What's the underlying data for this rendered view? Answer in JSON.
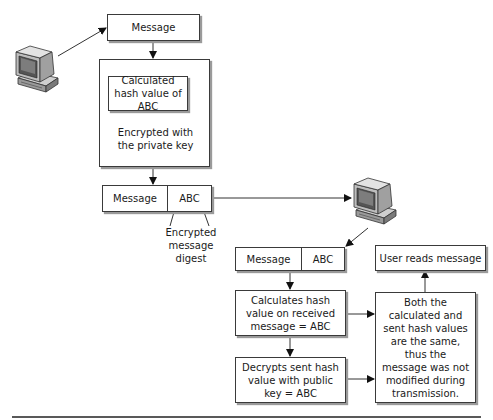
{
  "diagram": {
    "sender": {
      "computer_icon": "computer-icon",
      "message_label": "Message",
      "hash_box_label": "Calculated hash value of ABC",
      "encrypt_label": "Encrypted with the private key"
    },
    "transmitted_packet": {
      "message_label": "Message",
      "digest_label": "ABC",
      "annotation": "Encrypted message digest"
    },
    "receiver": {
      "computer_icon": "computer-icon",
      "packet": {
        "message_label": "Message",
        "digest_label": "ABC"
      },
      "calc_step": "Calculates hash value on received message = ABC",
      "decrypt_step": "Decrypts sent hash value with public key = ABC",
      "comparison": "Both the calculated and sent hash values are the same, thus the message was not modified during transmission.",
      "result": "User reads message"
    }
  }
}
